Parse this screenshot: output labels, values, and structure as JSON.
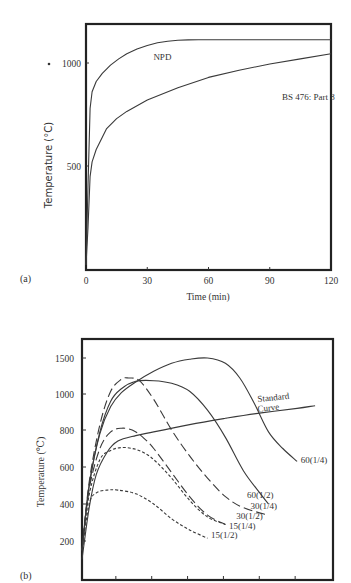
{
  "chart_data": [
    {
      "id": "a",
      "type": "line",
      "panel_label": "(a)",
      "title": "",
      "xlabel": "Time (min)",
      "ylabel": "Temperature (°C)",
      "xlim": [
        0,
        120
      ],
      "ylim": [
        0,
        1150
      ],
      "xticks": [
        0,
        30,
        60,
        90,
        120
      ],
      "yticks": [
        500,
        1000
      ],
      "grid": false,
      "series": [
        {
          "name": "NPD",
          "style": "solid",
          "x": [
            0,
            1,
            2,
            3,
            5,
            8,
            12,
            16,
            20,
            25,
            30,
            35,
            40,
            45,
            50,
            55,
            60,
            90,
            120
          ],
          "y": [
            20,
            400,
            780,
            860,
            910,
            950,
            990,
            1020,
            1045,
            1068,
            1085,
            1098,
            1106,
            1110,
            1112,
            1113,
            1113,
            1113,
            1113
          ]
        },
        {
          "name": "BS 476: Part 8",
          "style": "solid",
          "x": [
            0,
            1,
            2,
            3,
            5,
            8,
            10,
            15,
            20,
            30,
            45,
            60,
            75,
            90,
            105,
            120
          ],
          "y": [
            20,
            200,
            450,
            520,
            580,
            640,
            680,
            730,
            765,
            820,
            880,
            930,
            965,
            995,
            1020,
            1045
          ]
        }
      ],
      "annotations": [
        {
          "text": "NPD",
          "x": 33,
          "y": 1015
        },
        {
          "text": "BS 476: Part 8",
          "x": 96,
          "y": 820
        }
      ]
    },
    {
      "id": "b",
      "type": "line",
      "panel_label": "(b)",
      "title": "",
      "xlabel": "",
      "ylabel": "Temperature (℃)",
      "xlim": [
        0,
        7
      ],
      "xtick_count": 7,
      "yticks": [
        200,
        400,
        600,
        800,
        1000,
        1500
      ],
      "ytick_positions_note": "nonlinear axis spacing as printed",
      "grid": false,
      "series": [
        {
          "name": "Standard Curve",
          "style": "thick",
          "x": [
            0,
            0.2,
            0.4,
            0.7,
            1.0,
            1.5,
            2.0,
            3.0,
            4.0,
            5.0,
            6.0,
            6.5
          ],
          "y": [
            100,
            380,
            560,
            680,
            740,
            770,
            790,
            830,
            865,
            895,
            920,
            935
          ]
        },
        {
          "name": "60(1/4)",
          "style": "solid",
          "x": [
            0,
            0.2,
            0.5,
            0.8,
            1.1,
            1.5,
            2.0,
            2.5,
            3.0,
            3.5,
            4.0,
            4.4,
            4.8,
            5.2,
            5.6,
            6.0
          ],
          "y": [
            150,
            500,
            780,
            930,
            1010,
            1090,
            1170,
            1230,
            1260,
            1270,
            1230,
            1120,
            950,
            790,
            700,
            630
          ]
        },
        {
          "name": "60(1/2)",
          "style": "solid",
          "x": [
            0,
            0.2,
            0.5,
            0.8,
            1.1,
            1.5,
            2.0,
            2.5,
            3.0,
            3.5,
            4.0,
            4.5,
            5.0,
            5.2
          ],
          "y": [
            150,
            500,
            790,
            960,
            1040,
            1095,
            1100,
            1080,
            1020,
            910,
            760,
            580,
            450,
            400
          ]
        },
        {
          "name": "30(1/4)",
          "style": "long-dash",
          "x": [
            0,
            0.2,
            0.5,
            0.8,
            1.1,
            1.3,
            1.6,
            2.0,
            2.5,
            3.0,
            3.5,
            4.0,
            4.5,
            5.2
          ],
          "y": [
            150,
            520,
            830,
            1020,
            1110,
            1120,
            1100,
            970,
            800,
            660,
            540,
            440,
            380,
            340
          ]
        },
        {
          "name": "30(1/2)",
          "style": "long-dash",
          "x": [
            0,
            0.2,
            0.5,
            0.8,
            1.1,
            1.4,
            1.7,
            2.0,
            2.5,
            3.0,
            3.5,
            4.0
          ],
          "y": [
            150,
            480,
            700,
            790,
            810,
            800,
            760,
            700,
            570,
            440,
            340,
            290
          ]
        },
        {
          "name": "15(1/4)",
          "style": "short-dash",
          "x": [
            0,
            0.2,
            0.5,
            0.8,
            1.1,
            1.4,
            1.7,
            2.0,
            2.5,
            3.0,
            3.5,
            4.0
          ],
          "y": [
            150,
            450,
            640,
            690,
            705,
            700,
            680,
            640,
            540,
            420,
            330,
            290
          ]
        },
        {
          "name": "15(1/2)",
          "style": "short-dash",
          "x": [
            0,
            0.2,
            0.4,
            0.7,
            1.0,
            1.5,
            2.0,
            2.5,
            3.0,
            3.5
          ],
          "y": [
            150,
            400,
            460,
            475,
            475,
            455,
            400,
            320,
            260,
            215
          ]
        }
      ],
      "annotations": [
        {
          "text": "Standard",
          "x": 4.9,
          "y": 955
        },
        {
          "text": "Curve",
          "x": 4.9,
          "y": 900
        },
        {
          "text": "60(1/4)",
          "x": 6.1,
          "y": 620
        },
        {
          "text": "60(1/2)",
          "x": 4.6,
          "y": 430
        },
        {
          "text": "30(1/4)",
          "x": 4.7,
          "y": 375
        },
        {
          "text": "30(1/2)",
          "x": 4.3,
          "y": 320
        },
        {
          "text": "15(1/4)",
          "x": 4.1,
          "y": 265
        },
        {
          "text": "15(1/2)",
          "x": 3.6,
          "y": 215
        }
      ]
    }
  ]
}
